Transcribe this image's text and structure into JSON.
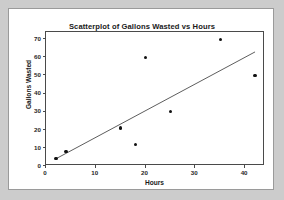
{
  "chart_data": {
    "type": "scatter",
    "title": "Scatterplot of Gallons Wasted vs Hours",
    "xlabel": "Hours",
    "ylabel": "Gallons Wasted",
    "xlim": [
      0,
      44
    ],
    "ylim": [
      0,
      74
    ],
    "grid": false,
    "legend": null,
    "xticks": [
      0,
      10,
      20,
      30,
      40
    ],
    "xtick_labels": [
      "0",
      "10",
      "20",
      "30",
      "40"
    ],
    "yticks": [
      0,
      10,
      20,
      30,
      40,
      50,
      60,
      70
    ],
    "ytick_labels": [
      "0",
      "10",
      "20",
      "30",
      "40",
      "50",
      "60",
      "70"
    ],
    "marker": "filled-circle",
    "marker_color": "#111111",
    "points": [
      {
        "x": 2,
        "y": 4
      },
      {
        "x": 4,
        "y": 8
      },
      {
        "x": 15,
        "y": 21
      },
      {
        "x": 18,
        "y": 12
      },
      {
        "x": 20,
        "y": 60
      },
      {
        "x": 25,
        "y": 30
      },
      {
        "x": 35,
        "y": 70
      },
      {
        "x": 42,
        "y": 50
      }
    ],
    "x": [
      2,
      4,
      15,
      18,
      20,
      25,
      35,
      42
    ],
    "y": [
      4,
      8,
      21,
      12,
      60,
      30,
      70,
      50
    ],
    "fit_line": {
      "type": "linear",
      "color": "#333333",
      "x_start": 2,
      "y_start": 4,
      "x_end": 42,
      "y_end": 63
    }
  },
  "figure": {
    "background_color": "#cccccc",
    "card_color": "#ffffff",
    "axis_color": "#4a4a4a"
  }
}
